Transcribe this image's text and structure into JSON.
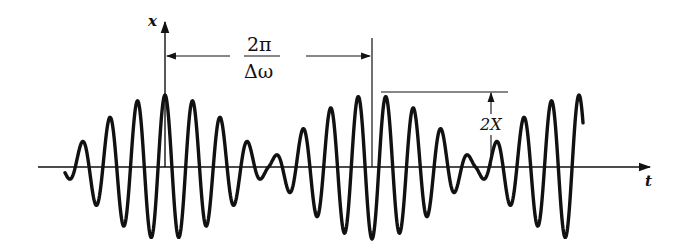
{
  "figure": {
    "type": "beat-phenomenon-waveform",
    "axes": {
      "vertical_label": "x",
      "horizontal_label": "t"
    },
    "annotations": {
      "beat_period_numerator": "2π",
      "beat_period_denominator": "Δω",
      "amplitude_label": "2X"
    },
    "colors": {
      "ink": "#111111",
      "background": "#ffffff"
    }
  },
  "chart_data": {
    "type": "line",
    "title": "",
    "xlabel": "t",
    "ylabel": "x",
    "beat_period_label": "2π/Δω",
    "peak_amplitude_label": "2X",
    "carrier_cycles_per_beat": 7.5,
    "envelope_peaks_marked": 2,
    "grid": false,
    "legend": null
  }
}
